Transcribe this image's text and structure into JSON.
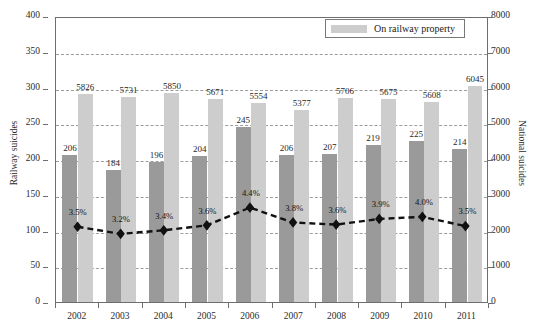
{
  "chart_data": {
    "type": "bar",
    "title": "",
    "xlabel": "",
    "categories": [
      "2002",
      "2003",
      "2004",
      "2005",
      "2006",
      "2007",
      "2008",
      "2009",
      "2010",
      "2011"
    ],
    "axes": {
      "left": {
        "label": "Railway suicides",
        "min": 0,
        "max": 400,
        "step": 50,
        "ticks": [
          "0",
          "50",
          "100",
          "150",
          "200",
          "250",
          "300",
          "350",
          "400"
        ]
      },
      "right": {
        "label": "National suicides",
        "min": 0,
        "max": 8000,
        "step": 1000,
        "ticks": [
          "0",
          "1000",
          "2000",
          "3000",
          "4000",
          "5000",
          "6000",
          "7000",
          "8000"
        ]
      }
    },
    "grid": true,
    "legend": {
      "position": "top-right",
      "entries": [
        {
          "label": "On railway property",
          "color": "#cdcdcd",
          "marker": "swatch"
        }
      ]
    },
    "series": [
      {
        "name": "Railway suicides",
        "type": "bar",
        "axis": "left",
        "color": "#9a9a9a",
        "values": [
          206,
          184,
          196,
          204,
          245,
          206,
          207,
          219,
          225,
          214
        ],
        "labels": [
          "206",
          "184",
          "196",
          "204",
          "245",
          "206",
          "207",
          "219",
          "225",
          "214"
        ]
      },
      {
        "name": "National suicides",
        "type": "bar",
        "axis": "right",
        "color": "#cdcdcd",
        "values": [
          5826,
          5731,
          5850,
          5671,
          5554,
          5377,
          5706,
          5675,
          5608,
          6045
        ],
        "labels": [
          "5826",
          "5731",
          "5850",
          "5671",
          "5554",
          "5377",
          "5706",
          "5675",
          "5608",
          "6045"
        ]
      },
      {
        "name": "On railway property",
        "type": "line",
        "axis": "left",
        "color": "#111111",
        "line_style": "dashed",
        "marker": "diamond",
        "values": [
          106,
          96,
          101,
          108,
          133,
          112,
          109,
          117,
          120,
          107
        ],
        "labels": [
          "3.5%",
          "3.2%",
          "3.4%",
          "3.6%",
          "4.4%",
          "3.8%",
          "3.6%",
          "3.9%",
          "4.0%",
          "3.5%"
        ]
      }
    ]
  }
}
